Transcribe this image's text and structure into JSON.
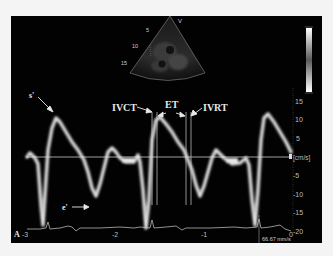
{
  "figure": {
    "panel_label": "A",
    "view_marker": "V",
    "sweep_speed": "66.67 mm/s",
    "y_unit": "[cm/s]",
    "depth_ticks": [
      "5",
      "10",
      "15"
    ],
    "y_ticks": [
      "15",
      "10",
      "5",
      "-5",
      "-10",
      "-15",
      "-20"
    ],
    "x_ticks": [
      "-3",
      "-2",
      "-1",
      "0"
    ],
    "annotations": {
      "s_prime": "s'",
      "e_prime": "e'",
      "ivct": "IVCT",
      "et": "ET",
      "ivrt": "IVRT"
    },
    "colors": {
      "background": "#020202",
      "trace": "#e0e0e0",
      "baseline": "#cfcfcf",
      "page": "#f4f4f4"
    }
  }
}
